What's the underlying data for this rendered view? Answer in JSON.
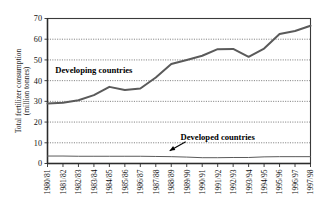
{
  "chart_data": {
    "type": "line",
    "title": "",
    "xlabel": "",
    "ylabel": "Total fertilizer consumption (million tonnes)",
    "ylim": [
      0,
      70
    ],
    "yticks": [
      0,
      10,
      20,
      30,
      40,
      50,
      60,
      70
    ],
    "grid": true,
    "legend_position": "inline-annotations",
    "categories": [
      "1980/81",
      "1981/82",
      "1982/83",
      "1983/84",
      "1984/85",
      "1985/86",
      "1986/87",
      "1987/88",
      "1988/89",
      "1989/90",
      "1990/91",
      "1991/92",
      "1992/93",
      "1993/94",
      "1994/95",
      "1995/96",
      "1996/97",
      "1997/98"
    ],
    "series": [
      {
        "name": "Developing countries",
        "values": [
          29.0,
          29.3,
          30.5,
          33.0,
          37.0,
          35.5,
          36.2,
          41.5,
          48.0,
          50.0,
          52.0,
          55.2,
          55.3,
          51.5,
          55.5,
          62.5,
          64.0,
          66.5
        ]
      },
      {
        "name": "Developed countries",
        "values": [
          3.6,
          3.6,
          3.5,
          3.5,
          3.5,
          3.5,
          3.5,
          3.4,
          3.3,
          3.1,
          2.8,
          2.8,
          2.9,
          2.9,
          3.2,
          3.3,
          3.3,
          3.3
        ]
      }
    ],
    "annotations": [
      {
        "text": "Developing countries",
        "x_category": "1983/84",
        "y_value": 43.5
      },
      {
        "text": "Developed countries",
        "x_category": "1991/92",
        "y_value": 11.5
      }
    ]
  }
}
